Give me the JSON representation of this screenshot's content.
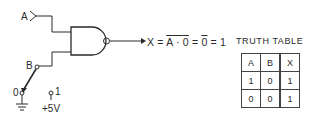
{
  "diagram": {
    "gate_type": "NAND",
    "inputs": {
      "a_label": "A",
      "b_label": "B"
    },
    "switch": {
      "position_0_label": "0",
      "position_1_label": "1",
      "supply_label": "+5V",
      "selected": "0"
    },
    "output": {
      "prefix": "X = ",
      "term_a": "A",
      "dot": " · ",
      "term_0": "0",
      "eq1": " = ",
      "result_overbar": "0",
      "eq2": " = ",
      "result": "1"
    }
  },
  "truth_table": {
    "title": "TRUTH TABLE",
    "headers": [
      "A",
      "B",
      "X"
    ],
    "rows": [
      [
        "1",
        "0",
        "1"
      ],
      [
        "0",
        "0",
        "1"
      ]
    ]
  },
  "colors": {
    "ink": "#2a2a2a",
    "background": "#ffffff"
  }
}
